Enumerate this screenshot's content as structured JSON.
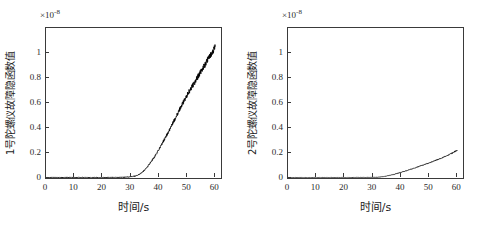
{
  "figure": {
    "panel_count": 2,
    "background_color": "#ffffff",
    "line_color": "#000000"
  },
  "chart_data": [
    {
      "type": "line",
      "title": "",
      "panel_index": 1,
      "xlabel": "时间/s",
      "ylabel": "1号陀螺仪故障隐函数值",
      "y_exponent_label": "×10",
      "y_exponent_value": "-8",
      "xlim": [
        0,
        62
      ],
      "ylim": [
        0,
        1.2
      ],
      "xticks": [
        0,
        10,
        20,
        30,
        40,
        50,
        60
      ],
      "xticklabels": [
        "0",
        "10",
        "20",
        "30",
        "40",
        "50",
        "60"
      ],
      "yticks": [
        0,
        0.2,
        0.4,
        0.6,
        0.8,
        1
      ],
      "yticklabels": [
        "0",
        "0.2",
        "0.4",
        "0.6",
        "0.8",
        "1"
      ],
      "grid": false,
      "legend": null,
      "series": [
        {
          "name": "1号陀螺仪故障隐函数值",
          "color": "#000000",
          "noise_amplitude": 0.022,
          "x": [
            0,
            1,
            2,
            3,
            4,
            5,
            6,
            7,
            8,
            9,
            10,
            11,
            12,
            13,
            14,
            15,
            16,
            17,
            18,
            19,
            20,
            21,
            22,
            23,
            24,
            25,
            26,
            27,
            28,
            29,
            30,
            31,
            32,
            33,
            34,
            35,
            36,
            37,
            38,
            39,
            40,
            41,
            42,
            43,
            44,
            45,
            46,
            47,
            48,
            49,
            50,
            51,
            52,
            53,
            54,
            55,
            56,
            57,
            58,
            59,
            60
          ],
          "y": [
            0.004,
            0.004,
            0.004,
            0.005,
            0.004,
            0.005,
            0.004,
            0.005,
            0.004,
            0.005,
            0.004,
            0.005,
            0.004,
            0.005,
            0.005,
            0.004,
            0.005,
            0.004,
            0.005,
            0.005,
            0.004,
            0.005,
            0.005,
            0.006,
            0.005,
            0.006,
            0.006,
            0.006,
            0.007,
            0.008,
            0.01,
            0.013,
            0.018,
            0.028,
            0.044,
            0.066,
            0.092,
            0.122,
            0.155,
            0.19,
            0.228,
            0.268,
            0.31,
            0.352,
            0.396,
            0.441,
            0.486,
            0.532,
            0.578,
            0.622,
            0.664,
            0.703,
            0.74,
            0.778,
            0.818,
            0.858,
            0.896,
            0.934,
            0.972,
            1.01,
            1.05
          ]
        }
      ]
    },
    {
      "type": "line",
      "title": "",
      "panel_index": 2,
      "xlabel": "时间/s",
      "ylabel": "2号陀螺仪故障隐函数值",
      "y_exponent_label": "×10",
      "y_exponent_value": "-8",
      "xlim": [
        0,
        62
      ],
      "ylim": [
        0,
        1.2
      ],
      "xticks": [
        0,
        10,
        20,
        30,
        40,
        50,
        60
      ],
      "xticklabels": [
        "0",
        "10",
        "20",
        "30",
        "40",
        "50",
        "60"
      ],
      "yticks": [
        0,
        0.2,
        0.4,
        0.6,
        0.8,
        1
      ],
      "yticklabels": [
        "0",
        "0.2",
        "0.4",
        "0.6",
        "0.8",
        "1"
      ],
      "grid": false,
      "legend": null,
      "series": [
        {
          "name": "2号陀螺仪故障隐函数值",
          "color": "#000000",
          "noise_amplitude": 0.012,
          "x": [
            0,
            1,
            2,
            3,
            4,
            5,
            6,
            7,
            8,
            9,
            10,
            11,
            12,
            13,
            14,
            15,
            16,
            17,
            18,
            19,
            20,
            21,
            22,
            23,
            24,
            25,
            26,
            27,
            28,
            29,
            30,
            31,
            32,
            33,
            34,
            35,
            36,
            37,
            38,
            39,
            40,
            41,
            42,
            43,
            44,
            45,
            46,
            47,
            48,
            49,
            50,
            51,
            52,
            53,
            54,
            55,
            56,
            57,
            58,
            59,
            60
          ],
          "y": [
            0.003,
            0.003,
            0.003,
            0.003,
            0.003,
            0.003,
            0.003,
            0.003,
            0.003,
            0.003,
            0.003,
            0.003,
            0.003,
            0.003,
            0.003,
            0.003,
            0.003,
            0.003,
            0.003,
            0.003,
            0.003,
            0.003,
            0.003,
            0.004,
            0.004,
            0.004,
            0.004,
            0.004,
            0.004,
            0.005,
            0.005,
            0.006,
            0.007,
            0.009,
            0.012,
            0.016,
            0.021,
            0.026,
            0.032,
            0.038,
            0.045,
            0.052,
            0.059,
            0.066,
            0.073,
            0.081,
            0.089,
            0.097,
            0.105,
            0.113,
            0.121,
            0.129,
            0.138,
            0.147,
            0.156,
            0.166,
            0.176,
            0.187,
            0.198,
            0.21,
            0.222
          ]
        }
      ]
    }
  ]
}
